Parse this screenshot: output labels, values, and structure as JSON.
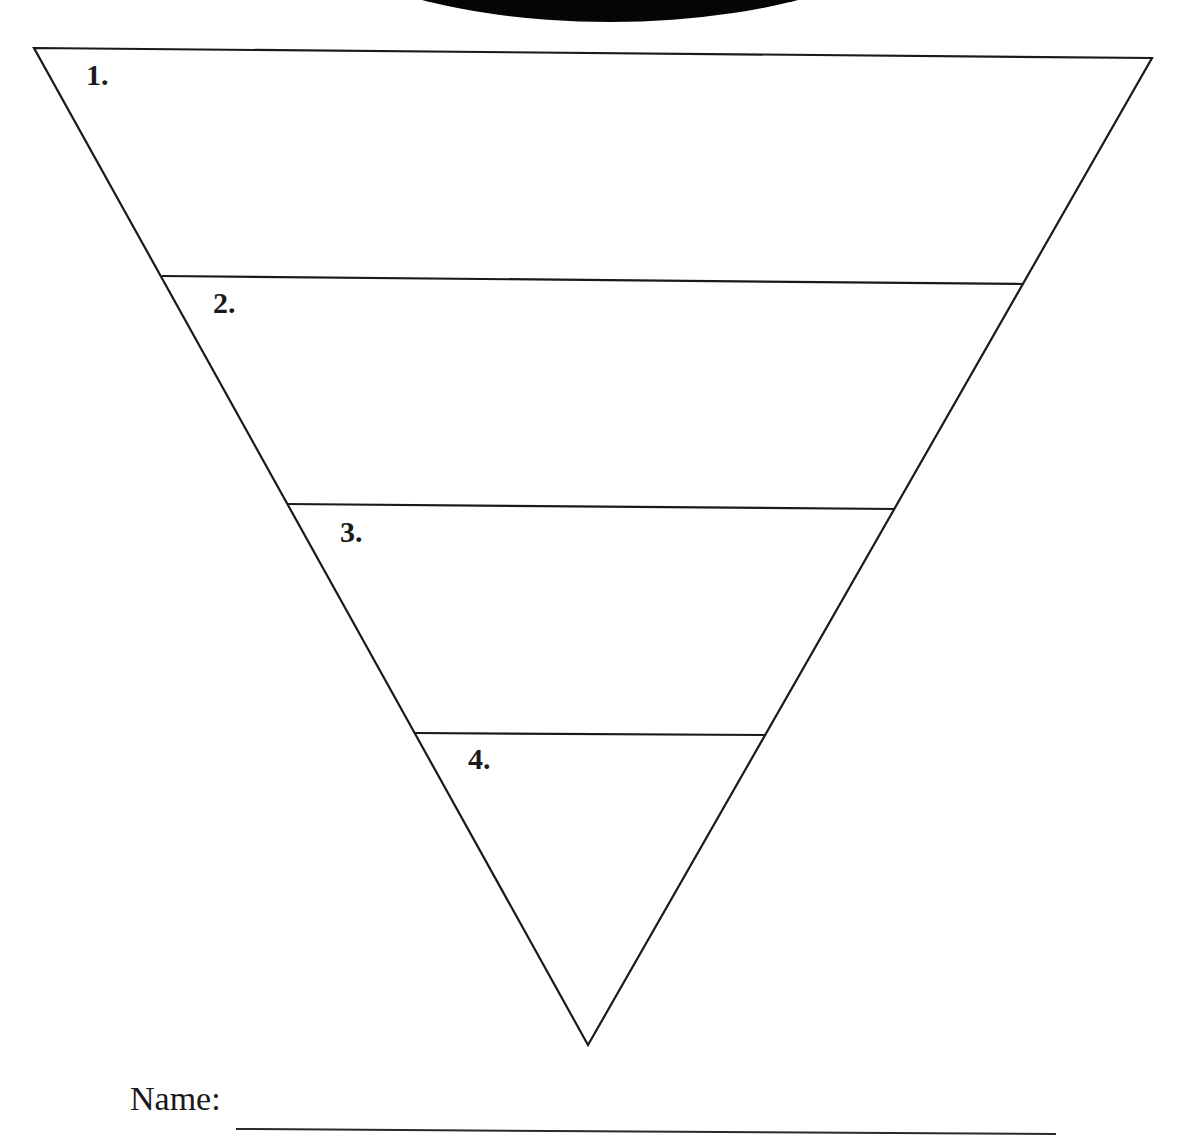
{
  "worksheet": {
    "type": "inverted-triangle-graphic-organizer",
    "header_shape": "black-ellipse-arc",
    "line_color": "#1a1a1a",
    "sections": [
      {
        "label": "1.",
        "label_x": 86,
        "label_y": 60
      },
      {
        "label": "2.",
        "label_x": 213,
        "label_y": 288
      },
      {
        "label": "3.",
        "label_x": 340,
        "label_y": 517
      },
      {
        "label": "4.",
        "label_x": 468,
        "label_y": 744
      }
    ],
    "triangle": {
      "top_left": [
        34,
        48
      ],
      "top_right": [
        1152,
        58
      ],
      "bottom": [
        588,
        1045
      ]
    },
    "dividers": [
      {
        "left": [
          162,
          276
        ],
        "right": [
          1022,
          284
        ]
      },
      {
        "left": [
          287,
          504
        ],
        "right": [
          895,
          509
        ]
      },
      {
        "left": [
          414,
          733
        ],
        "right": [
          765,
          735
        ]
      }
    ],
    "footer": {
      "name_label": "Name:",
      "name_value": ""
    }
  }
}
